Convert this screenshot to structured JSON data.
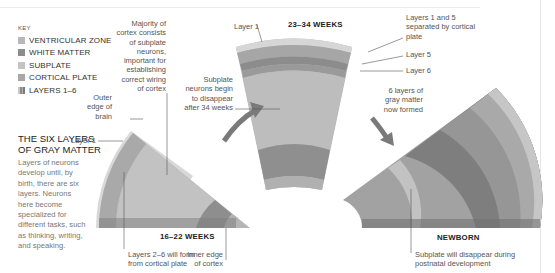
{
  "key": {
    "title": "KEY",
    "items": [
      {
        "label": "VENTRICULAR ZONE",
        "color": "#b8b8b8"
      },
      {
        "label": "WHITE MATTER",
        "color": "#8c8c8c"
      },
      {
        "label": "SUBPLATE",
        "color": "#c4c4c4"
      },
      {
        "label": "CORTICAL PLATE",
        "color": "#a8a8a8"
      },
      {
        "label": "LAYERS 1–6",
        "color": "#999999"
      }
    ]
  },
  "sidebar": {
    "heading_line1": "THE SIX LAYERS",
    "heading_line2": "OF GRAY MATTER",
    "body_lines": [
      "Layers of neurons",
      "develop until, by",
      "birth, there are six",
      "layers. Neurons",
      "here become",
      "specialized for",
      "different tasks, such",
      "as thinking, writing,",
      "and speaking."
    ]
  },
  "stages": [
    {
      "label": "16–22 WEEKS"
    },
    {
      "label": "23–34 WEEKS"
    },
    {
      "label": "NEWBORN"
    }
  ],
  "annotations": {
    "majority": [
      "Majority of",
      "cortex consists",
      "of subplate",
      "neurons,",
      "important for",
      "establishing",
      "correct wiring",
      "of cortex"
    ],
    "outer_edge": [
      "Outer",
      "edge of",
      "brain"
    ],
    "layer1_left": "Layer 1",
    "layers_2_6": [
      "Layers 2–6 will form",
      "from cortical plate"
    ],
    "inner_edge": [
      "Inner edge",
      "of cortex"
    ],
    "layer1_top": "Layer 1",
    "subplate_disappear": [
      "Subplate",
      "neurons begin",
      "to disappear",
      "after 34 weeks"
    ],
    "layers_1_5": [
      "Layers 1 and 5",
      "separated by cortical",
      "plate"
    ],
    "layer5": "Layer 5",
    "layer6": "Layer 6",
    "six_layers": [
      "6 layers of",
      "gray matter",
      "now formed"
    ],
    "subplate_newborn": [
      "Subplate will disappear during",
      "postnatal development"
    ]
  }
}
